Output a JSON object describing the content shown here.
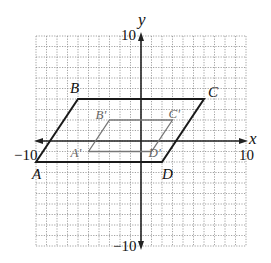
{
  "figure": {
    "type": "coordinate-plane",
    "axes": {
      "x_label": "x",
      "y_label": "y",
      "x_min_label": "−10",
      "x_max_label": "10",
      "y_min_label": "−10",
      "y_max_label": "10",
      "range": [
        -10,
        10
      ],
      "grid_step": 1
    },
    "original": {
      "name": "ABCD",
      "color": "#1a1a1a",
      "vertices": [
        {
          "label": "A",
          "x": -10,
          "y": -2
        },
        {
          "label": "B",
          "x": -6,
          "y": 4
        },
        {
          "label": "C",
          "x": 6,
          "y": 4
        },
        {
          "label": "D",
          "x": 2,
          "y": -2
        }
      ]
    },
    "image": {
      "name": "A'B'C'D'",
      "color": "#777777",
      "vertices": [
        {
          "label": "A'",
          "x": -5,
          "y": -1
        },
        {
          "label": "B'",
          "x": -3,
          "y": 2
        },
        {
          "label": "C'",
          "x": 3,
          "y": 2
        },
        {
          "label": "D'",
          "x": 1,
          "y": -1
        }
      ]
    }
  }
}
